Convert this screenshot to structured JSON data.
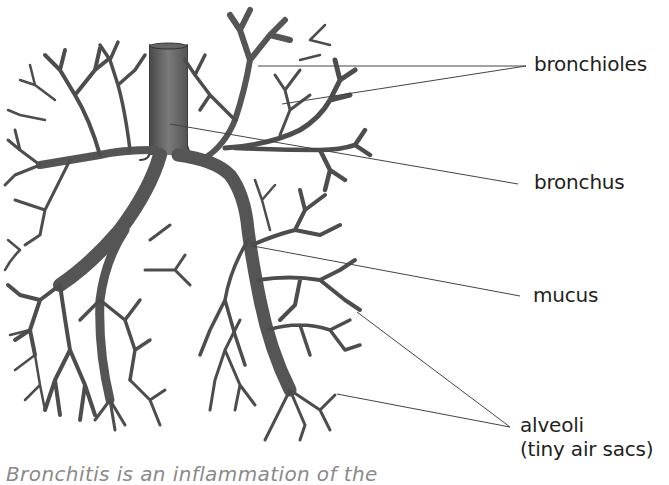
{
  "diagram": {
    "labels": [
      {
        "id": "bronchioles",
        "text": "bronchioles",
        "x": 534,
        "y": 53,
        "targets": [
          [
            258,
            66
          ],
          [
            282,
            104
          ]
        ],
        "anchor": [
          526,
          66
        ]
      },
      {
        "id": "bronchus",
        "text": "bronchus",
        "x": 534,
        "y": 171,
        "targets": [
          [
            170,
            124
          ]
        ],
        "anchor": [
          518,
          184
        ]
      },
      {
        "id": "mucus",
        "text": "mucus",
        "x": 533,
        "y": 284,
        "targets": [
          [
            253,
            246
          ]
        ],
        "anchor": [
          520,
          296
        ]
      },
      {
        "id": "alveoli",
        "text": "alveoli",
        "x": 520,
        "y": 414,
        "targets": [
          [
            357,
            312
          ],
          [
            337,
            394
          ]
        ],
        "anchor": [
          510,
          427
        ]
      },
      {
        "id": "alveoli-sub",
        "text": "(tiny air sacs)",
        "x": 520,
        "y": 438
      }
    ],
    "colors": {
      "background": "#ffffff",
      "airway_fill": "#5a5a5a",
      "airway_dark": "#3a3a3a",
      "leader_line": "#444444",
      "label_text": "#231f20",
      "caption_text": "#8a8a8a"
    }
  },
  "caption": {
    "text": "Bronchitis is an inflammation of the"
  }
}
